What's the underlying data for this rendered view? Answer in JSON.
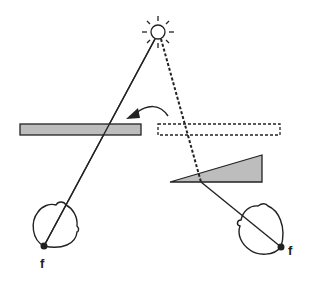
{
  "diagram": {
    "colors": {
      "stroke": "#222222",
      "fill_gray": "#bdbdbd",
      "background": "#ffffff"
    },
    "light_source": {
      "icon": "sun-icon",
      "cx": 158,
      "cy": 32
    },
    "occluders": [
      {
        "name": "solid-bar",
        "style": "solid",
        "x": 20,
        "y": 124,
        "w": 121,
        "h": 11
      },
      {
        "name": "dashed-bar",
        "style": "dashed",
        "x": 158,
        "y": 124,
        "w": 122,
        "h": 11
      },
      {
        "name": "wedge",
        "style": "solid",
        "points": "170,182 262,182 262,155"
      }
    ],
    "arrow": {
      "direction": "right-to-left",
      "from": "dashed-bar",
      "to": "solid-bar"
    },
    "eyes": [
      {
        "name": "left-eye",
        "fovea_label": "f"
      },
      {
        "name": "right-eye",
        "fovea_label": "f"
      }
    ]
  }
}
